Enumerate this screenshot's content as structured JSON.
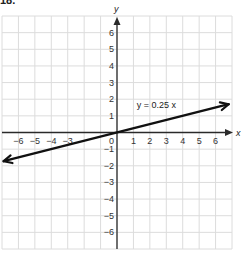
{
  "problem": {
    "number": "18."
  },
  "chart_data": {
    "type": "line",
    "title": "",
    "xlabel": "x",
    "ylabel": "y",
    "xlim": [
      -7,
      7
    ],
    "ylim": [
      -7,
      7
    ],
    "grid": true,
    "x_ticks": [
      "-6",
      "-5",
      "-4",
      "-3",
      "1",
      "2",
      "3",
      "4",
      "5",
      "6"
    ],
    "y_ticks": [
      "6",
      "5",
      "4",
      "3",
      "2",
      "1",
      "-1",
      "-2",
      "-3",
      "-4",
      "-5",
      "-6"
    ],
    "origin_label": "0",
    "series": [
      {
        "name": "y = 0.25 x",
        "equation": "y = 0.25 x",
        "slope": 0.25,
        "intercept": 0,
        "x": [
          -6.9,
          6.8
        ],
        "y": [
          -1.725,
          1.7
        ],
        "arrows": "both",
        "color": "#111111"
      }
    ],
    "annotations": [
      {
        "text": "y = 0.25 x",
        "x": 1.2,
        "y": 1.5
      }
    ]
  },
  "colors": {
    "grid": "#dcdcdc",
    "axis": "#2a2a2a",
    "line": "#111111"
  }
}
